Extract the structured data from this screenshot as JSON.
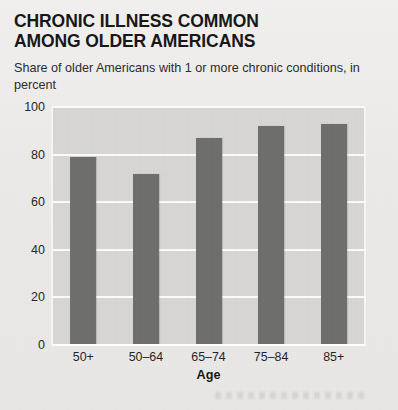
{
  "title": {
    "line1": "CHRONIC ILLNESS COMMON",
    "line2": "AMONG OLDER AMERICANS"
  },
  "subtitle": "Share of older Americans with 1 or more chronic conditions, in percent",
  "colors": {
    "bar": "#6d6d6b",
    "plot_background": "#d7d6d4",
    "gridline": "#fbfbfa",
    "page_background": "#eeecea",
    "text": "#1a1a1a"
  },
  "chart_data": {
    "type": "bar",
    "title": "CHRONIC ILLNESS COMMON AMONG OLDER AMERICANS",
    "subtitle": "Share of older Americans with 1 or more chronic conditions, in percent",
    "categories": [
      "50+",
      "50–64",
      "65–74",
      "75–84",
      "85+"
    ],
    "values": [
      79,
      72,
      87,
      92,
      93
    ],
    "xlabel": "Age",
    "ylabel": "",
    "ylim": [
      0,
      100
    ],
    "yticks": [
      0,
      20,
      40,
      60,
      80,
      100
    ],
    "ytick_labels": [
      "0",
      "20",
      "40",
      "60",
      "80",
      "100"
    ],
    "grid": true,
    "legend": false
  }
}
